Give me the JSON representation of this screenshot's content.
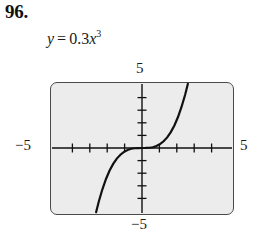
{
  "problem": {
    "number": "96."
  },
  "equation": {
    "lhs": "y",
    "operator": "=",
    "coefficient": "0.3",
    "variable": "x",
    "exponent": "3",
    "full_text": "y = 0.3x^3"
  },
  "graph": {
    "axis_labels": {
      "top": "5",
      "left": "−5",
      "right": "5",
      "bottom": "−5"
    },
    "colors": {
      "window_fill": "#ececec",
      "window_border": "#4a4a4a",
      "axis": "#111111",
      "curve": "#111111",
      "page_background": "#ffffff"
    }
  },
  "chart_data": {
    "type": "line",
    "title": "",
    "subtitle": "",
    "xlabel": "",
    "ylabel": "",
    "function": "y = 0.3x^3",
    "coefficient": 0.3,
    "power": 3,
    "xlim": [
      -5,
      5
    ],
    "ylim": [
      -5,
      5
    ],
    "xticks": [
      -4,
      -3,
      -2,
      -1,
      1,
      2,
      3,
      4
    ],
    "yticks": [
      -4,
      -3,
      -2,
      -1,
      1,
      2,
      3,
      4
    ],
    "xtick_labels": [
      "-5",
      "5"
    ],
    "ytick_labels": [
      "-5",
      "5"
    ],
    "grid": false,
    "legend": false,
    "axes_style": "centered-crosshair-with-tickmarks",
    "x": [
      -2.55,
      -2.4,
      -2.2,
      -2.0,
      -1.8,
      -1.6,
      -1.4,
      -1.2,
      -1.0,
      -0.8,
      -0.6,
      -0.4,
      -0.2,
      0.0,
      0.2,
      0.4,
      0.6,
      0.8,
      1.0,
      1.2,
      1.4,
      1.6,
      1.8,
      2.0,
      2.2,
      2.4,
      2.55
    ],
    "y": [
      -4.98,
      -4.15,
      -3.2,
      -2.4,
      -1.75,
      -1.23,
      -0.82,
      -0.52,
      -0.3,
      -0.15,
      -0.06,
      -0.02,
      -0.002,
      0.0,
      0.002,
      0.02,
      0.06,
      0.15,
      0.3,
      0.52,
      0.82,
      1.23,
      1.75,
      2.4,
      3.2,
      4.15,
      4.98
    ],
    "series": [
      {
        "name": "y = 0.3x^3",
        "color": "#111111",
        "values": [
          -4.98,
          -4.15,
          -3.2,
          -2.4,
          -1.75,
          -1.23,
          -0.82,
          -0.52,
          -0.3,
          -0.15,
          -0.06,
          -0.02,
          -0.002,
          0.0,
          0.002,
          0.02,
          0.06,
          0.15,
          0.3,
          0.52,
          0.82,
          1.23,
          1.75,
          2.4,
          3.2,
          4.15,
          4.98
        ]
      }
    ]
  }
}
